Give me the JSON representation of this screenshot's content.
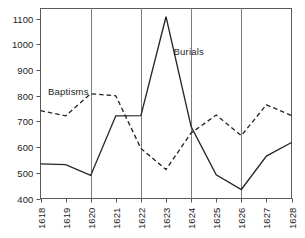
{
  "chart_data": {
    "type": "line",
    "title": "",
    "subtitle": "",
    "xlabel": "",
    "ylabel": "",
    "categories": [
      "1618",
      "1619",
      "1620",
      "1621",
      "1622",
      "1623",
      "1624",
      "1625",
      "1626",
      "1627",
      "1628"
    ],
    "x": [
      1618,
      1619,
      1620,
      1621,
      1622,
      1623,
      1624,
      1625,
      1626,
      1627,
      1628
    ],
    "xlim": [
      1618,
      1628
    ],
    "ylim": [
      400,
      1140
    ],
    "yticks": [
      400,
      500,
      600,
      700,
      800,
      900,
      1000,
      1100
    ],
    "ytick_labels": [
      "400",
      "500",
      "600",
      "700",
      "800",
      "900",
      "1000",
      "1100"
    ],
    "xtick_labels": [
      "1618",
      "1619",
      "1620",
      "1621",
      "1622",
      "1623",
      "1624",
      "1625",
      "1626",
      "1627",
      "1628"
    ],
    "grid": "vertical-only",
    "gridlines_x": [
      1620,
      1622,
      1624,
      1626
    ],
    "legend": "inline-annotations",
    "series": [
      {
        "name": "Burials",
        "style": "solid",
        "color": "#262626",
        "values": [
          535,
          532,
          490,
          722,
          723,
          1108,
          680,
          492,
          435,
          565,
          618
        ]
      },
      {
        "name": "Baptisms",
        "style": "dashed",
        "color": "#262626",
        "values": [
          742,
          722,
          808,
          800,
          595,
          513,
          655,
          725,
          645,
          765,
          723
        ]
      }
    ],
    "annotations": [
      {
        "text": "Baptisms",
        "x": 1618.3,
        "y": 805
      },
      {
        "text": "Burials",
        "x": 1623.3,
        "y": 960
      }
    ]
  },
  "axes": {
    "frame_color": "#555555",
    "gridline_color": "#7d7d7d",
    "tick_color": "#555555"
  }
}
